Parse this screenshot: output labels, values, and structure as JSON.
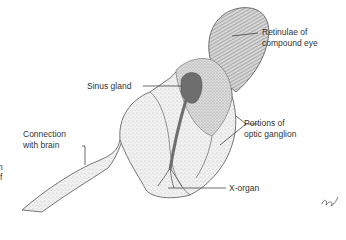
{
  "figure": {
    "labels": {
      "retinulae_line1": "Retinulae of",
      "retinulae_line2": "compound eye",
      "sinus_gland": "Sinus gland",
      "optic_line1": "Portions of",
      "optic_line2": "optic ganglion",
      "brain_line1": "Connection",
      "brain_line2": "with brain",
      "x_organ": "X-organ"
    },
    "edge_fragments": [
      "n",
      "f"
    ],
    "colors": {
      "outline": "#555555",
      "stipple_light": "#e4e4e4",
      "stipple_mid": "#c8c8c8",
      "gland": "#6e6e6e",
      "leader": "#444444"
    }
  }
}
